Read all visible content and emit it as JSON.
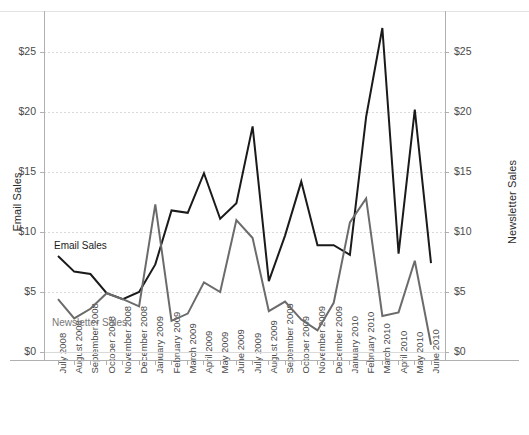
{
  "axes": {
    "left_title": "Email Sales",
    "right_title": "Newsletter Sales",
    "y_ticks": [
      "$0",
      "$5",
      "$10",
      "$15",
      "$20",
      "$25"
    ]
  },
  "series_labels": {
    "email": "Email Sales",
    "newsletter": "Newsletter Sales"
  },
  "colors": {
    "email": "#1a1a1a",
    "newsletter": "#6b6b6b",
    "grid": "#d9d9d9",
    "axis": "#b0b0b0",
    "background": "#ffffff"
  },
  "chart_data": {
    "type": "line",
    "title": "",
    "xlabel": "",
    "ylabel": "Email Sales",
    "y2label": "Newsletter Sales",
    "ylim": [
      0,
      27.5
    ],
    "y2lim": [
      0,
      27.5
    ],
    "yticks": [
      0,
      5,
      10,
      15,
      20,
      25
    ],
    "grid": true,
    "legend_position": "inline-annotation",
    "categories": [
      "July 2008",
      "August 2008",
      "September 2008",
      "October 2008",
      "November 2008",
      "December 2008",
      "January 2009",
      "February 2009",
      "March 2009",
      "April 2009",
      "May 2009",
      "June 2009",
      "July 2009",
      "August 2009",
      "September 2009",
      "October 2009",
      "November 2009",
      "December 2009",
      "January 2010",
      "February 2010",
      "March 2010",
      "April 2010",
      "May 2010",
      "June 2010"
    ],
    "series": [
      {
        "name": "Email Sales",
        "axis": "left",
        "color": "#1a1a1a",
        "values": [
          8.0,
          6.7,
          6.5,
          4.9,
          4.4,
          5.0,
          7.3,
          11.8,
          11.6,
          14.9,
          11.1,
          12.4,
          18.8,
          5.9,
          9.7,
          14.2,
          8.9,
          8.9,
          8.1,
          19.6,
          27.0,
          8.2,
          20.2,
          7.4
        ]
      },
      {
        "name": "Newsletter Sales",
        "axis": "right",
        "color": "#6b6b6b",
        "values": [
          4.4,
          2.8,
          3.6,
          4.9,
          4.4,
          3.8,
          12.3,
          2.6,
          3.2,
          5.8,
          5.0,
          11.0,
          9.5,
          3.4,
          4.2,
          2.7,
          1.8,
          4.1,
          10.8,
          12.8,
          3.0,
          3.3,
          7.6,
          0.6
        ]
      }
    ]
  }
}
